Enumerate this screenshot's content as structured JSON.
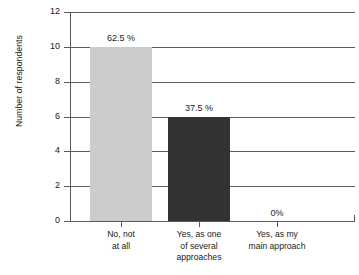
{
  "chart_data": {
    "type": "bar",
    "title": "",
    "subtitle": "",
    "xlabel": "",
    "ylabel": "Number of respondents",
    "ylim": [
      0,
      12
    ],
    "ytick_step": 2,
    "yticks": [
      0,
      2,
      4,
      6,
      8,
      10,
      12
    ],
    "ytick_labels": [
      "0",
      "2",
      "4",
      "6",
      "8",
      "10",
      "12"
    ],
    "grid": "horizontal",
    "legend": "none",
    "categories": [
      "No, not\nat all",
      "Yes, as one\nof several\napproaches",
      "Yes, as my\nmain approach"
    ],
    "values": [
      10,
      6,
      0
    ],
    "data_labels": [
      "62.5 %",
      "37.5 %",
      "0%"
    ],
    "bar_colors": [
      "#cccccc",
      "#333333",
      "#cccccc"
    ],
    "total_respondents": 16
  },
  "axes": {
    "y_title": "Number of respondents",
    "y_ticks": [
      {
        "value": 12,
        "label": "12"
      },
      {
        "value": 10,
        "label": "10"
      },
      {
        "value": 8,
        "label": "8"
      },
      {
        "value": 6,
        "label": "6"
      },
      {
        "value": 4,
        "label": "4"
      },
      {
        "value": 2,
        "label": "2"
      },
      {
        "value": 0,
        "label": "0"
      }
    ]
  },
  "bars": [
    {
      "name": "no-not-at-all",
      "value": 10,
      "percent_label": "62.5 %",
      "color": "#cccccc",
      "label_line1": "No, not",
      "label_line2": "at all",
      "label_line3": ""
    },
    {
      "name": "yes-one-of-several",
      "value": 6,
      "percent_label": "37.5 %",
      "color": "#333333",
      "label_line1": "Yes, as one",
      "label_line2": "of several",
      "label_line3": "approaches"
    },
    {
      "name": "yes-main-approach",
      "value": 0,
      "percent_label": "0%",
      "color": "#cccccc",
      "label_line1": "Yes, as my",
      "label_line2": "main approach",
      "label_line3": ""
    }
  ],
  "colors": {
    "axis": "#5a5a5a",
    "grid": "#5a5a5a",
    "text": "#1a1a1a",
    "background": "#ffffff",
    "bar_light": "#cccccc",
    "bar_dark": "#333333"
  }
}
